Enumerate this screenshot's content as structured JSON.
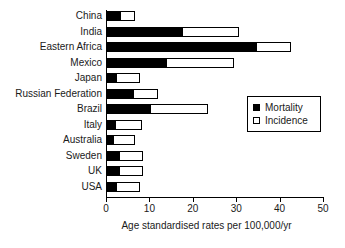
{
  "chart_data": {
    "type": "bar",
    "orientation": "horizontal",
    "stacked_overlay": true,
    "title": "",
    "xlabel": "Age standardised rates per 100,000/yr",
    "ylabel": "",
    "xlim": [
      0,
      50
    ],
    "xticks": [
      0,
      10,
      20,
      30,
      40,
      50
    ],
    "xtick_labels": [
      "0",
      "10",
      "20",
      "30",
      "40",
      "50"
    ],
    "grid": false,
    "legend_position": "center-right",
    "categories": [
      "China",
      "India",
      "Eastern Africa",
      "Mexico",
      "Japan",
      "Russian Federation",
      "Brazil",
      "Italy",
      "Australia",
      "Sweden",
      "UK",
      "USA"
    ],
    "series": [
      {
        "name": "Mortality",
        "color": "#000000",
        "values": [
          3.2,
          17.5,
          34.5,
          13.8,
          2.2,
          6.2,
          10.1,
          2.0,
          1.6,
          3.0,
          3.0,
          2.2
        ]
      },
      {
        "name": "Incidence",
        "color": "#ffffff",
        "values": [
          6.4,
          30.5,
          42.3,
          29.3,
          7.5,
          11.8,
          23.2,
          8.0,
          6.5,
          8.2,
          8.3,
          7.7
        ]
      }
    ]
  },
  "legend": {
    "items": [
      {
        "label": "Mortality",
        "swatch": "filled-square-icon"
      },
      {
        "label": "Incidence",
        "swatch": "open-square-icon"
      }
    ]
  }
}
